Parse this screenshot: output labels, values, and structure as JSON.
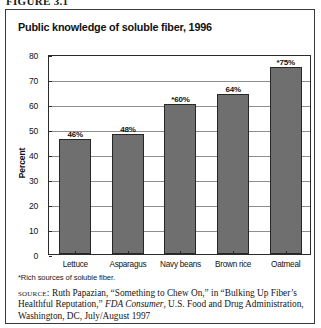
{
  "figure": {
    "label": "FIGURE 3.1"
  },
  "chart_data": {
    "type": "bar",
    "title": "Public knowledge of soluble fiber, 1996",
    "xlabel": "",
    "ylabel": "Percent",
    "ylim": [
      0,
      80
    ],
    "yticks": [
      0,
      10,
      20,
      30,
      40,
      50,
      60,
      70,
      80
    ],
    "grid": true,
    "legend": "none",
    "categories": [
      "Lettuce",
      "Asparagus",
      "Navy beans",
      "Brown rice",
      "Oatmeal"
    ],
    "values": [
      46,
      48,
      60,
      64,
      75
    ],
    "data_labels": [
      "46%",
      "48%",
      "*60%",
      "64%",
      "*75%"
    ],
    "bar_color": "#6f6f6f",
    "bar_edge_color": "#272727"
  },
  "notes": {
    "footnote": "*Rich sources of soluble fiber.",
    "source_word": "source:",
    "source_text_1": " Ruth Papazian, “Something to Chew On,” in “Bulking Up Fiber’s Healthful Reputation,” ",
    "source_italic": "FDA Consumer",
    "source_text_2": ", U.S. Food and Drug Administration, Washington, DC, July/August 1997"
  }
}
